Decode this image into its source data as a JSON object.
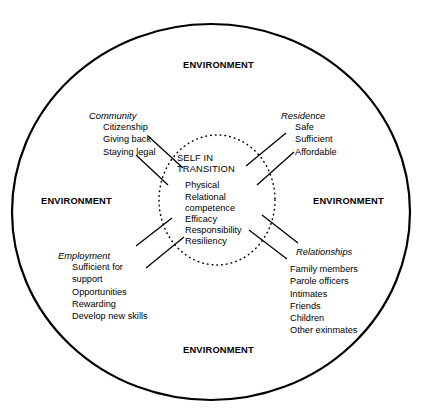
{
  "figure": {
    "type": "concentric-ecological-diagram",
    "core": {
      "title_line_1": "SELF IN",
      "title_line_2": "TRANSITION",
      "attributes": [
        "Physical",
        "Relational",
        "competence",
        "Efficacy",
        "Responsibility",
        "Resiliency"
      ]
    },
    "environment_labels": {
      "top": "ENVIRONMENT",
      "left": "ENVIRONMENT",
      "right": "ENVIRONMENT",
      "bottom": "ENVIRONMENT"
    },
    "clusters": [
      {
        "id": "community",
        "position": "top-left",
        "title": "Community",
        "items": [
          "Citizenship",
          "Giving back",
          "Staying legal"
        ]
      },
      {
        "id": "residence",
        "position": "top-right",
        "title": "Residence",
        "items": [
          "Safe",
          "Sufficient",
          "Affordable"
        ]
      },
      {
        "id": "employment",
        "position": "bottom-left",
        "title": "Employment",
        "items": [
          "Sufficient for",
          "support",
          "Opportunities",
          "Rewarding",
          "Develop new skills"
        ]
      },
      {
        "id": "relationships",
        "position": "bottom-right",
        "title": "Relationships",
        "items": [
          "Family members",
          "Parole officers",
          "Intimates",
          "Friends",
          "Children",
          "Other exinmates"
        ]
      }
    ],
    "colors": {
      "stroke": "#000000",
      "background": "#ffffff",
      "text": "#000000"
    }
  }
}
